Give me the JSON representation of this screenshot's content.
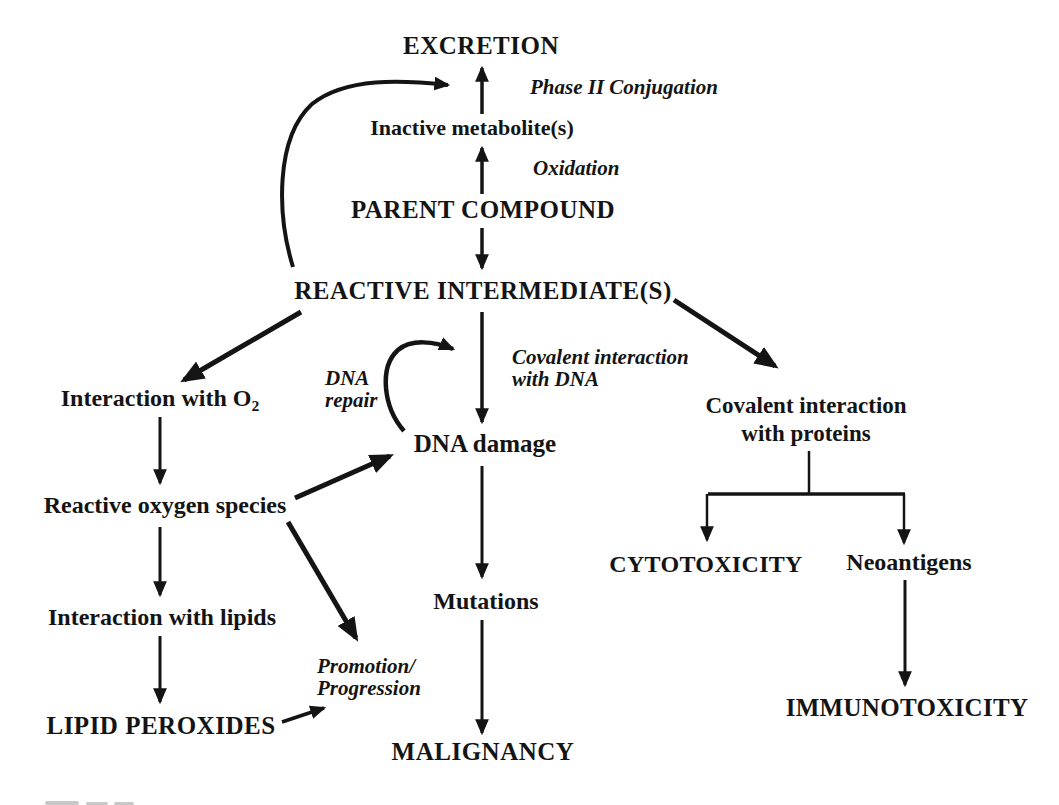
{
  "figure": {
    "background": "#ffffff",
    "ink_color": "#141414",
    "nodes": {
      "excretion": "EXCRETION",
      "inactive_metabolites": "Inactive metabolite(s)",
      "parent_compound": "PARENT COMPOUND",
      "reactive_intermediates": "REACTIVE INTERMEDIATE(S)",
      "interaction_with_o2": {
        "text": "Interaction with O",
        "subscript": "2"
      },
      "reactive_oxygen_species": "Reactive oxygen species",
      "interaction_with_lipids": "Interaction with lipids",
      "lipid_peroxides": "LIPID PEROXIDES",
      "dna_damage": "DNA damage",
      "mutations": "Mutations",
      "malignancy": "MALIGNANCY",
      "covalent_interaction_proteins": {
        "line1": "Covalent interaction",
        "line2": "with proteins"
      },
      "cytotoxicity": "CYTOTOXICITY",
      "neoantigens": "Neoantigens",
      "immunotoxicity": "IMMUNOTOXICITY"
    },
    "edge_labels": {
      "phase_ii_conjugation": "Phase II Conjugation",
      "oxidation": "Oxidation",
      "dna_repair": {
        "line1": "DNA",
        "line2": "repair"
      },
      "covalent_interaction_dna": {
        "line1": "Covalent interaction",
        "line2": "with DNA"
      },
      "promotion_progression": {
        "line1": "Promotion/",
        "line2": "Progression"
      }
    }
  }
}
